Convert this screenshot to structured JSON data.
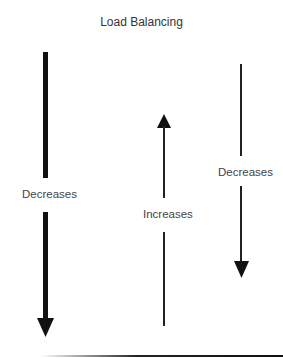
{
  "title": "Load Balancing",
  "arrows": [
    {
      "id": "left",
      "direction": "down",
      "weight": "thick",
      "label": "Decreases"
    },
    {
      "id": "middle",
      "direction": "up",
      "weight": "thin",
      "label": "Increases"
    },
    {
      "id": "right",
      "direction": "down",
      "weight": "thin",
      "label": "Decreases"
    }
  ],
  "colors": {
    "arrow": "#111111",
    "text": "#333333",
    "background": "#ffffff"
  }
}
